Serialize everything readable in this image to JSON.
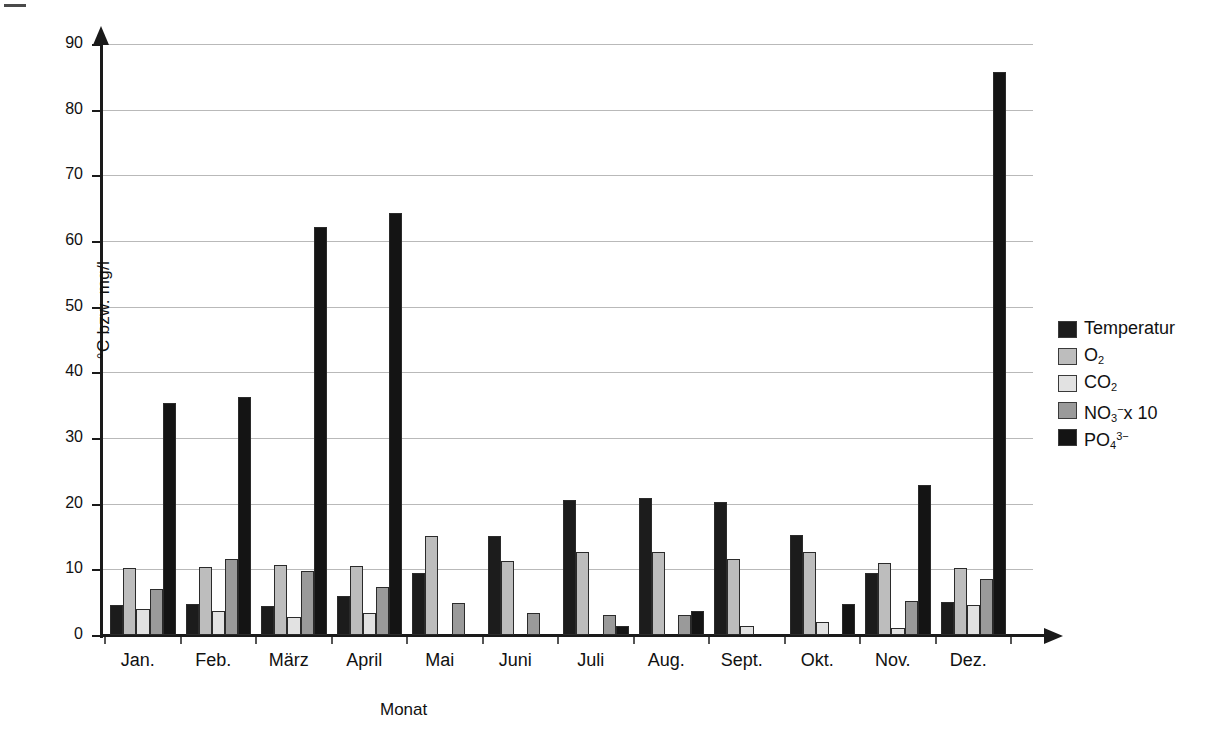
{
  "chart_data": {
    "type": "bar",
    "title": "",
    "xlabel": "Monat",
    "ylabel": "°C bzw. mg/l",
    "ylim": [
      0,
      90
    ],
    "ytick_step": 10,
    "yticks": [
      "0",
      "10",
      "20",
      "30",
      "40",
      "50",
      "60",
      "70",
      "80",
      "90"
    ],
    "grid": true,
    "legend_position": "right",
    "categories": [
      "Jan.",
      "Feb.",
      "März",
      "April",
      "Mai",
      "Juni",
      "Juli",
      "Aug.",
      "Sept.",
      "Okt.",
      "Nov.",
      "Dez."
    ],
    "series": [
      {
        "name": "Temperatur",
        "legend_html": "Temperatur",
        "color": "#1c1c1c",
        "values": [
          4.5,
          4.7,
          4.4,
          6.0,
          9.5,
          15.1,
          20.5,
          20.8,
          20.3,
          15.3,
          9.5,
          5.1
        ]
      },
      {
        "name": "O2",
        "legend_html": "O<sub>2</sub>",
        "color": "#bdbdbd",
        "values": [
          10.2,
          10.3,
          10.7,
          10.5,
          15.1,
          11.3,
          12.6,
          12.6,
          11.6,
          12.7,
          11.0,
          10.2
        ]
      },
      {
        "name": "CO2",
        "legend_html": "CO<sub>2</sub>",
        "color": "#e2e2e2",
        "values": [
          4.0,
          3.7,
          2.7,
          3.3,
          0.0,
          0.0,
          0.0,
          0.0,
          1.4,
          2.0,
          1.0,
          4.6
        ]
      },
      {
        "name": "NO3- x 10",
        "legend_html": "NO<sub>3</sub><sup>−</sup>x 10",
        "color": "#9a9a9a",
        "values": [
          7.0,
          11.6,
          9.7,
          7.3,
          4.8,
          3.4,
          3.1,
          3.0,
          0.0,
          0.0,
          5.2,
          8.5
        ]
      },
      {
        "name": "PO43-",
        "legend_html": "PO<sub>4</sub><sup>3−</sup>",
        "color": "#141414",
        "values": [
          35.3,
          36.3,
          62.2,
          64.3,
          0.0,
          0.0,
          1.4,
          3.6,
          0.0,
          4.7,
          22.8,
          85.8
        ]
      }
    ]
  },
  "colors": {
    "axis": "#1a1a1a",
    "grid": "#b9b9b9",
    "background": "#ffffff"
  }
}
